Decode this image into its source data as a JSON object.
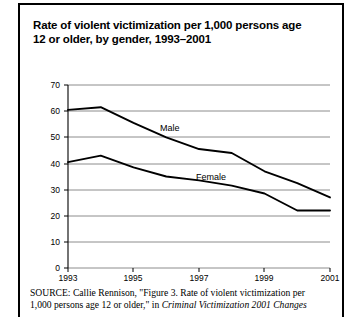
{
  "figure": {
    "title": "Rate of violent victimization per 1,000 persons age 12 or older, by gender, 1993–2001",
    "source_kicker": "SOURCE:",
    "source_line1": "Callie Rennison, \"Figure 3. Rate of violent victimization per",
    "source_line2_a": "1,000 persons age 12 or older,\" in ",
    "source_line2_italic": "Criminal Victimization 2001 Changes"
  },
  "chart_data": {
    "type": "line",
    "title": "Rate of violent victimization per 1,000 persons age 12 or older, by gender, 1993–2001",
    "xlabel": "",
    "ylabel": "",
    "x": [
      1993,
      1994,
      1995,
      1996,
      1997,
      1998,
      1999,
      2000,
      2001
    ],
    "xtick_labels": [
      "1993",
      "1995",
      "1997",
      "1999",
      "2001"
    ],
    "xtick_values": [
      1993,
      1995,
      1997,
      1999,
      2001
    ],
    "ytick_labels": [
      "0",
      "10",
      "20",
      "30",
      "40",
      "50",
      "60",
      "70"
    ],
    "ytick_values": [
      0,
      10,
      20,
      30,
      40,
      50,
      60,
      70
    ],
    "ylim": [
      0,
      70
    ],
    "xlim": [
      1993,
      2001
    ],
    "grid": "horizontal",
    "legend": "inline-labels",
    "series": [
      {
        "name": "Male",
        "label": "Male",
        "color": "#000000",
        "values": [
          60.5,
          61.5,
          55.5,
          50.0,
          45.5,
          44.0,
          37.0,
          32.5,
          27.0
        ]
      },
      {
        "name": "Female",
        "label": "Female",
        "color": "#000000",
        "values": [
          40.5,
          43.0,
          38.5,
          35.0,
          33.5,
          31.5,
          28.5,
          22.0,
          22.0
        ]
      }
    ]
  },
  "colors": {
    "frame": "#000000",
    "gridline": "#8c8c8c",
    "axis": "#000000",
    "line": "#1a1a1a",
    "background": "#ffffff"
  }
}
